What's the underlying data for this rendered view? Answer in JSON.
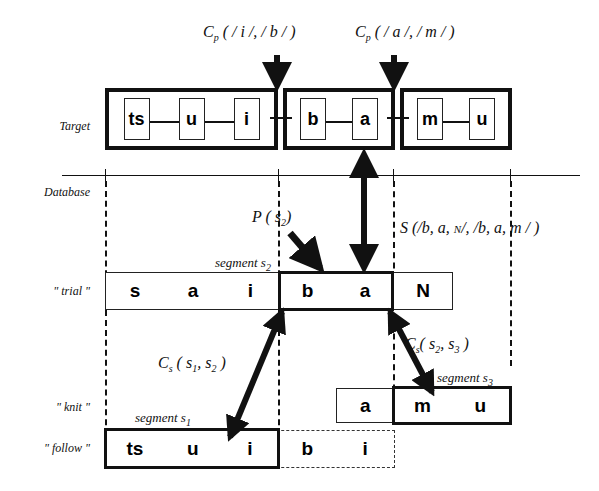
{
  "diagram": {
    "row_labels": {
      "target": "Target",
      "database": "Database",
      "trial": "\" trial \"",
      "knit": "\" knit \"",
      "follow": "\" follow \""
    },
    "cost_labels": {
      "cp_ib": "C",
      "cp_ib_sub": "p",
      "cp_ib_args": "( / i /, / b / )",
      "cp_am": "C",
      "cp_am_sub": "p",
      "cp_am_args": "( / a /, / m / )",
      "p_s2": "P ( s",
      "p_s2_sub": "2",
      "p_s2_close": ")",
      "s_sub": "S (/b, a, ",
      "s_n": "N",
      "s_rest": "/, /b, a, m / )",
      "cs_s1s2": "C",
      "cs_s1s2_sub": "s",
      "cs_s1s2_args": "( s",
      "cs_s1s2_arg1": "1",
      "cs_s1s2_mid": ", s",
      "cs_s1s2_arg2": "2",
      "cs_s1s2_close": ")",
      "cs_s2s3": "C",
      "cs_s2s3_sub": "s",
      "cs_s2s3_args": "( s",
      "cs_s2s3_arg1": "2",
      "cs_s2s3_mid": ", s",
      "cs_s2s3_arg2": "3",
      "cs_s2s3_close": ")"
    },
    "segment_labels": {
      "s1": "segment s",
      "s1_sub": "1",
      "s2": "segment s",
      "s2_sub": "2",
      "s3": "segment s",
      "s3_sub": "3"
    },
    "target_groups": [
      {
        "id": "group-tsui",
        "phonemes": [
          "ts",
          "u",
          "i"
        ]
      },
      {
        "id": "group-ba",
        "phonemes": [
          "b",
          "a"
        ]
      },
      {
        "id": "group-mu",
        "phonemes": [
          "m",
          "u"
        ]
      }
    ],
    "database_rows": [
      {
        "id": "trial",
        "label": "\" trial \"",
        "cells": [
          "s",
          "a",
          "i",
          "b",
          "a",
          "N"
        ],
        "highlight": [
          "b",
          "a"
        ]
      },
      {
        "id": "knit",
        "label": "\" knit \"",
        "cells": [
          "a",
          "m",
          "u"
        ],
        "highlight": [
          "m",
          "u"
        ]
      },
      {
        "id": "follow",
        "label": "\" follow \"",
        "cells": [
          "ts",
          "u",
          "i",
          "b",
          "i"
        ],
        "highlight": [
          "ts",
          "u",
          "i"
        ]
      }
    ],
    "colors": {
      "ink": "#111111",
      "paper": "#ffffff"
    }
  }
}
